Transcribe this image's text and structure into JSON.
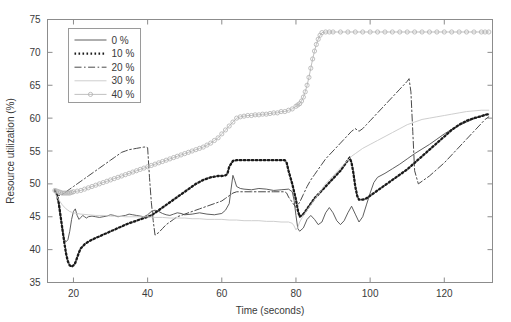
{
  "chart_data": {
    "type": "line",
    "title": "",
    "xlabel": "Time (seconds)",
    "ylabel": "Resource utilization (%)",
    "xlim": [
      13,
      133
    ],
    "ylim": [
      35,
      75
    ],
    "xticks": [
      20,
      40,
      60,
      80,
      100,
      120
    ],
    "yticks": [
      35,
      40,
      45,
      50,
      55,
      60,
      65,
      70,
      75
    ],
    "grid": false,
    "legend_position": "upper-left",
    "legend_entries": [
      "0 %",
      "10 %",
      "20 %",
      "30 %",
      "40 %"
    ],
    "series": [
      {
        "name": "0 %",
        "style": "solid",
        "color": "#4d4d4d",
        "marker": "none",
        "x": [
          15.0,
          15.5,
          16.0,
          16.5,
          17.0,
          17.5,
          18.0,
          18.5,
          19.0,
          19.5,
          20.0,
          20.5,
          21.0,
          21.5,
          22.0,
          22.5,
          23.0,
          23.5,
          24.0,
          25.0,
          26.0,
          27.0,
          28.0,
          29.0,
          30.0,
          31.0,
          32.0,
          33.0,
          34.0,
          35.0,
          36.0,
          37.0,
          38.0,
          39.0,
          40.0,
          41.0,
          42.0,
          43.0,
          44.0,
          45.0,
          46.0,
          47.0,
          48.0,
          49.0,
          50.0,
          52.0,
          54.0,
          56.0,
          58.0,
          60.0,
          61.0,
          62.0,
          62.5,
          63.0,
          63.5,
          64.0,
          65.0,
          66.0,
          68.0,
          70.0,
          72.0,
          74.0,
          76.0,
          78.0,
          79.0,
          79.5,
          80.0,
          80.5,
          81.0,
          82.0,
          83.0,
          84.0,
          85.0,
          86.0,
          87.0,
          88.0,
          89.0,
          90.0,
          91.0,
          92.0,
          93.0,
          94.0,
          95.0,
          96.0,
          97.0,
          98.0,
          99.0,
          100.0,
          101.0,
          102.0,
          104.0,
          106.0,
          108.0,
          110.0,
          112.0,
          114.0,
          116.0,
          118.0,
          120.0,
          122.0,
          124.0,
          126.0,
          128.0,
          130.0,
          131.0,
          132.0
        ],
        "y": [
          48.8,
          48.4,
          47.0,
          45.0,
          43.0,
          41.6,
          41.2,
          41.5,
          42.8,
          44.6,
          45.8,
          46.2,
          45.2,
          44.6,
          44.9,
          45.2,
          45.0,
          44.8,
          45.0,
          45.1,
          45.0,
          44.9,
          45.0,
          45.1,
          45.3,
          45.2,
          45.0,
          45.1,
          45.2,
          45.4,
          45.3,
          45.2,
          45.1,
          45.0,
          45.3,
          45.8,
          46.0,
          45.8,
          45.5,
          45.3,
          45.2,
          45.4,
          45.6,
          45.5,
          45.3,
          45.4,
          45.6,
          45.4,
          45.3,
          45.5,
          46.0,
          47.0,
          49.2,
          51.3,
          50.5,
          49.6,
          49.3,
          49.2,
          49.1,
          49.3,
          49.2,
          49.0,
          49.1,
          49.2,
          48.8,
          47.5,
          45.2,
          43.2,
          42.8,
          43.3,
          44.6,
          45.2,
          44.6,
          43.8,
          44.2,
          45.6,
          46.4,
          45.6,
          44.4,
          43.8,
          44.4,
          45.6,
          46.6,
          45.4,
          44.2,
          45.0,
          46.8,
          48.6,
          50.2,
          51.0,
          51.6,
          52.3,
          53.0,
          53.8,
          54.6,
          55.3,
          56.0,
          56.8,
          57.6,
          58.3,
          58.9,
          59.4,
          59.9,
          60.3,
          60.5,
          60.6
        ]
      },
      {
        "name": "10 %",
        "style": "dotted",
        "color": "#1a1a1a",
        "marker": "none",
        "x": [
          15.0,
          15.5,
          16.0,
          16.5,
          17.0,
          17.5,
          18.0,
          18.5,
          19.0,
          19.5,
          20.0,
          20.5,
          21.0,
          21.5,
          22.0,
          23.0,
          24.0,
          25.0,
          26.0,
          27.0,
          28.0,
          29.0,
          30.0,
          31.0,
          32.0,
          33.0,
          34.0,
          35.0,
          36.0,
          37.0,
          38.0,
          39.0,
          40.0,
          41.0,
          42.0,
          43.0,
          44.0,
          45.0,
          46.0,
          47.0,
          48.0,
          49.0,
          50.0,
          51.0,
          52.0,
          53.0,
          54.0,
          55.0,
          56.0,
          57.0,
          58.0,
          59.0,
          60.0,
          61.0,
          61.5,
          62.0,
          63.0,
          64.0,
          66.0,
          68.0,
          70.0,
          72.0,
          74.0,
          76.0,
          77.0,
          77.5,
          78.0,
          79.0,
          80.0,
          80.5,
          81.0,
          82.0,
          83.0,
          84.0,
          85.0,
          86.0,
          87.0,
          88.0,
          89.0,
          90.0,
          91.0,
          92.0,
          93.0,
          94.0,
          94.5,
          95.0,
          95.5,
          96.0,
          96.5,
          97.0,
          98.0,
          99.0,
          100.0,
          102.0,
          104.0,
          106.0,
          108.0,
          110.0,
          112.0,
          114.0,
          116.0,
          118.0,
          120.0,
          122.0,
          124.0,
          126.0,
          128.0,
          130.0,
          131.0,
          132.0
        ],
        "y": [
          49.0,
          48.5,
          47.2,
          45.2,
          43.2,
          41.2,
          39.4,
          38.2,
          37.6,
          37.4,
          37.6,
          38.0,
          38.8,
          39.6,
          40.2,
          40.8,
          41.2,
          41.5,
          41.8,
          42.0,
          42.3,
          42.5,
          42.8,
          43.0,
          43.3,
          43.5,
          43.8,
          44.0,
          44.2,
          44.4,
          44.6,
          44.8,
          45.0,
          45.2,
          45.6,
          46.0,
          46.4,
          46.8,
          47.2,
          47.6,
          48.0,
          48.4,
          48.8,
          49.2,
          49.6,
          50.0,
          50.3,
          50.6,
          50.8,
          51.0,
          51.1,
          51.2,
          51.2,
          51.3,
          51.5,
          52.6,
          53.5,
          53.6,
          53.6,
          53.6,
          53.6,
          53.6,
          53.6,
          53.6,
          53.6,
          53.2,
          52.0,
          50.0,
          47.6,
          46.0,
          45.0,
          45.4,
          46.2,
          47.0,
          47.8,
          48.4,
          49.0,
          49.6,
          50.2,
          50.8,
          51.4,
          52.0,
          52.8,
          53.6,
          54.0,
          53.2,
          51.6,
          49.6,
          48.2,
          47.6,
          47.6,
          47.8,
          48.2,
          49.0,
          49.8,
          50.6,
          51.4,
          52.2,
          53.2,
          54.2,
          55.2,
          56.2,
          57.2,
          58.2,
          59.0,
          59.6,
          60.0,
          60.3,
          60.5,
          60.6
        ]
      },
      {
        "name": "20 %",
        "style": "dashdot",
        "color": "#4a4a4a",
        "marker": "none",
        "x": [
          15.0,
          15.5,
          16.0,
          17.0,
          18.0,
          19.0,
          20.0,
          21.0,
          22.0,
          23.0,
          24.0,
          25.0,
          26.0,
          27.0,
          28.0,
          29.0,
          30.0,
          31.0,
          32.0,
          33.0,
          34.0,
          35.0,
          36.0,
          37.0,
          38.0,
          39.0,
          39.5,
          40.0,
          40.5,
          41.0,
          41.5,
          42.0,
          43.0,
          44.0,
          45.0,
          46.0,
          47.0,
          48.0,
          49.0,
          50.0,
          52.0,
          54.0,
          56.0,
          58.0,
          60.0,
          61.0,
          62.0,
          62.5,
          63.0,
          64.0,
          66.0,
          68.0,
          70.0,
          72.0,
          74.0,
          76.0,
          77.0,
          77.5,
          78.0,
          79.0,
          80.0,
          81.0,
          82.0,
          83.0,
          84.0,
          85.0,
          86.0,
          87.0,
          88.0,
          89.0,
          90.0,
          91.0,
          92.0,
          93.0,
          94.0,
          95.0,
          96.0,
          97.0,
          98.0,
          99.0,
          100.0,
          101.0,
          102.0,
          103.0,
          104.0,
          105.0,
          106.0,
          107.0,
          108.0,
          109.0,
          110.0,
          110.5,
          111.0,
          111.5,
          112.0,
          113.0,
          114.0,
          116.0,
          118.0,
          120.0,
          122.0,
          124.0,
          126.0,
          128.0,
          130.0,
          131.0,
          132.0
        ],
        "y": [
          48.9,
          48.6,
          48.2,
          48.4,
          48.8,
          49.2,
          49.6,
          50.0,
          50.4,
          50.8,
          51.2,
          51.6,
          52.0,
          52.4,
          52.8,
          53.2,
          53.6,
          54.0,
          54.4,
          54.8,
          55.0,
          55.2,
          55.3,
          55.4,
          55.5,
          55.6,
          55.6,
          55.5,
          51.0,
          47.2,
          44.4,
          42.2,
          42.6,
          43.2,
          43.8,
          44.2,
          44.6,
          45.0,
          45.2,
          45.4,
          45.8,
          46.2,
          46.6,
          47.0,
          47.4,
          47.8,
          48.2,
          48.4,
          48.6,
          48.8,
          48.8,
          48.8,
          48.8,
          48.8,
          48.8,
          48.8,
          48.8,
          48.6,
          48.0,
          47.2,
          46.4,
          47.2,
          48.4,
          49.6,
          50.6,
          51.4,
          52.2,
          53.0,
          53.8,
          54.4,
          55.0,
          55.6,
          56.2,
          56.8,
          57.4,
          58.0,
          58.4,
          58.0,
          58.4,
          59.0,
          59.6,
          60.2,
          60.8,
          61.4,
          62.0,
          62.6,
          63.2,
          63.8,
          64.4,
          65.0,
          65.6,
          66.0,
          64.0,
          58.0,
          52.0,
          50.0,
          50.4,
          51.2,
          52.2,
          53.2,
          54.4,
          55.6,
          56.8,
          58.0,
          59.2,
          59.8,
          60.2
        ]
      },
      {
        "name": "30 %",
        "style": "solid",
        "color": "#c8c8c8",
        "marker": "none",
        "x": [
          15.0,
          16.0,
          17.0,
          18.0,
          19.0,
          20.0,
          22.0,
          24.0,
          26.0,
          28.0,
          30.0,
          32.0,
          34.0,
          36.0,
          38.0,
          40.0,
          42.0,
          44.0,
          46.0,
          48.0,
          50.0,
          52.0,
          54.0,
          56.0,
          58.0,
          60.0,
          62.0,
          64.0,
          66.0,
          68.0,
          70.0,
          72.0,
          74.0,
          76.0,
          78.0,
          79.0,
          79.5,
          80.0,
          80.5,
          81.0,
          82.0,
          83.0,
          84.0,
          85.0,
          86.0,
          87.0,
          88.0,
          89.0,
          90.0,
          91.0,
          92.0,
          93.0,
          94.0,
          95.0,
          96.0,
          97.0,
          98.0,
          100.0,
          102.0,
          104.0,
          106.0,
          108.0,
          110.0,
          112.0,
          114.0,
          116.0,
          118.0,
          120.0,
          122.0,
          124.0,
          126.0,
          128.0,
          130.0,
          131.0,
          132.0
        ],
        "y": [
          48.6,
          47.6,
          46.8,
          46.2,
          45.8,
          45.6,
          45.4,
          45.3,
          45.2,
          45.2,
          45.1,
          45.1,
          45.0,
          45.0,
          45.0,
          45.0,
          44.9,
          44.9,
          44.8,
          44.8,
          44.8,
          44.7,
          44.7,
          44.6,
          44.6,
          44.6,
          44.5,
          44.5,
          44.4,
          44.4,
          44.4,
          44.3,
          44.3,
          44.2,
          44.2,
          44.0,
          43.6,
          43.0,
          43.4,
          44.2,
          45.2,
          46.0,
          46.8,
          47.6,
          48.4,
          49.2,
          50.0,
          50.6,
          51.2,
          51.8,
          52.4,
          53.0,
          53.6,
          54.2,
          54.6,
          55.0,
          55.4,
          56.0,
          56.6,
          57.2,
          57.8,
          58.4,
          59.0,
          59.4,
          59.8,
          60.0,
          60.2,
          60.4,
          60.6,
          60.8,
          61.0,
          61.1,
          61.2,
          61.2,
          61.2
        ]
      },
      {
        "name": "40 %",
        "style": "solid-marker",
        "color": "#b0b0b0",
        "marker": "circle",
        "x": [
          15.0,
          15.5,
          16.0,
          16.5,
          17.0,
          17.5,
          18.0,
          18.5,
          19.0,
          19.5,
          20.0,
          21.0,
          22.0,
          23.0,
          24.0,
          25.0,
          26.0,
          27.0,
          28.0,
          29.0,
          30.0,
          31.0,
          32.0,
          33.0,
          34.0,
          35.0,
          36.0,
          37.0,
          38.0,
          39.0,
          40.0,
          41.0,
          42.0,
          43.0,
          44.0,
          45.0,
          46.0,
          47.0,
          48.0,
          49.0,
          50.0,
          51.0,
          52.0,
          53.0,
          54.0,
          55.0,
          56.0,
          57.0,
          58.0,
          59.0,
          60.0,
          61.0,
          62.0,
          63.0,
          64.0,
          65.0,
          66.0,
          67.0,
          68.0,
          69.0,
          70.0,
          71.0,
          72.0,
          73.0,
          74.0,
          75.0,
          76.0,
          77.0,
          78.0,
          79.0,
          80.0,
          80.5,
          81.0,
          81.5,
          82.0,
          82.5,
          83.0,
          83.5,
          84.0,
          84.5,
          85.0,
          85.5,
          86.0,
          86.5,
          87.0,
          88.0,
          89.0,
          90.0,
          92.0,
          94.0,
          96.0,
          98.0,
          100.0,
          102.0,
          104.0,
          106.0,
          108.0,
          110.0,
          112.0,
          114.0,
          116.0,
          118.0,
          120.0,
          122.0,
          124.0,
          126.0,
          128.0,
          130.0,
          131.0,
          132.0
        ],
        "y": [
          49.0,
          48.9,
          48.8,
          48.7,
          48.6,
          48.6,
          48.6,
          48.6,
          48.6,
          48.7,
          48.8,
          48.9,
          49.0,
          49.2,
          49.4,
          49.6,
          49.8,
          50.0,
          50.2,
          50.4,
          50.6,
          50.8,
          51.0,
          51.2,
          51.4,
          51.6,
          51.8,
          52.0,
          52.2,
          52.4,
          52.6,
          52.8,
          53.0,
          53.2,
          53.4,
          53.6,
          53.8,
          54.0,
          54.2,
          54.4,
          54.6,
          54.8,
          55.0,
          55.2,
          55.4,
          55.6,
          55.9,
          56.2,
          56.6,
          57.0,
          57.6,
          58.2,
          58.8,
          59.4,
          60.0,
          60.2,
          60.3,
          60.4,
          60.4,
          60.5,
          60.5,
          60.6,
          60.6,
          60.7,
          60.8,
          60.8,
          61.0,
          61.0,
          61.2,
          61.4,
          61.8,
          62.0,
          62.2,
          62.6,
          63.2,
          64.0,
          65.0,
          66.2,
          67.6,
          69.0,
          70.2,
          71.2,
          72.0,
          72.6,
          73.0,
          73.1,
          73.1,
          73.1,
          73.1,
          73.1,
          73.1,
          73.1,
          73.1,
          73.1,
          73.1,
          73.1,
          73.1,
          73.1,
          73.1,
          73.1,
          73.1,
          73.1,
          73.1,
          73.1,
          73.1,
          73.1,
          73.1,
          73.1,
          73.1,
          73.1
        ]
      }
    ]
  }
}
